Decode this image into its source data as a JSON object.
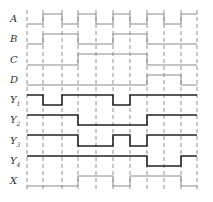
{
  "boundaries": [
    27,
    43,
    62,
    78,
    96,
    113,
    130,
    147,
    164,
    181,
    197
  ],
  "grid_top": 10,
  "grid_bottom": 190,
  "colors": {
    "input": "#8a8a8a",
    "output": "#222222",
    "grid": "#777777",
    "x": "#8a8a8a"
  },
  "signals": [
    {
      "name": "A",
      "sub": "",
      "high": 14,
      "low": 24,
      "kind": "input",
      "values": [
        0,
        1,
        0,
        1,
        0,
        1,
        0,
        1,
        0,
        1
      ]
    },
    {
      "name": "B",
      "sub": "",
      "high": 34,
      "low": 44,
      "kind": "input",
      "values": [
        0,
        1,
        1,
        0,
        0,
        1,
        1,
        0,
        0,
        0
      ]
    },
    {
      "name": "C",
      "sub": "",
      "high": 54,
      "low": 65,
      "kind": "input",
      "values": [
        0,
        0,
        0,
        1,
        1,
        1,
        1,
        0,
        0,
        0
      ]
    },
    {
      "name": "D",
      "sub": "",
      "high": 75,
      "low": 85,
      "kind": "input",
      "values": [
        0,
        0,
        0,
        0,
        0,
        0,
        0,
        1,
        1,
        0
      ]
    },
    {
      "name": "Y",
      "sub": "1",
      "high": 95,
      "low": 105,
      "kind": "output",
      "values": [
        1,
        0,
        1,
        1,
        1,
        0,
        1,
        1,
        1,
        1
      ]
    },
    {
      "name": "Y",
      "sub": "2",
      "high": 115,
      "low": 125,
      "kind": "output",
      "values": [
        1,
        1,
        1,
        0,
        0,
        0,
        0,
        1,
        1,
        1
      ]
    },
    {
      "name": "Y",
      "sub": "3",
      "high": 135,
      "low": 146,
      "kind": "output",
      "values": [
        1,
        1,
        1,
        0,
        0,
        1,
        0,
        1,
        1,
        1
      ]
    },
    {
      "name": "Y",
      "sub": "4",
      "high": 156,
      "low": 166,
      "kind": "output",
      "values": [
        1,
        1,
        1,
        1,
        1,
        1,
        1,
        0,
        0,
        1
      ]
    },
    {
      "name": "X",
      "sub": "",
      "high": 176,
      "low": 186,
      "kind": "x",
      "values": [
        0,
        0,
        0,
        1,
        1,
        0,
        1,
        1,
        1,
        0
      ]
    }
  ]
}
